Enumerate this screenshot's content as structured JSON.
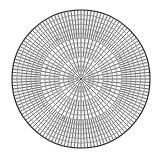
{
  "diagram": {
    "background_color": "#ffffff",
    "tick_color": "#111111",
    "ring_color": "#1c1c1c",
    "outer_border_color": "#141414",
    "speck_color": "#4a4a4a",
    "center": {
      "x": 81,
      "y": 79
    },
    "inner_radius": 3.5,
    "outer_radius": 69,
    "ring_count": 15,
    "base_spokes": 16,
    "target_arc_spacing": 2.8,
    "tick_stroke_width": 0.85,
    "ring_stroke_width": 0.55,
    "outer_border_width": 1.1,
    "center_dot_radius": 1.1,
    "inner_hub_spokes": 8,
    "tick_opacity": 0.78,
    "ring_opacity": 0.82,
    "specks": [
      {
        "x": 57,
        "y": 39,
        "r": 1.3
      },
      {
        "x": 97,
        "y": 33,
        "r": 1.1
      },
      {
        "x": 88,
        "y": 48,
        "r": 1.0
      },
      {
        "x": 47,
        "y": 68,
        "r": 1.2
      },
      {
        "x": 64,
        "y": 118,
        "r": 1.2
      },
      {
        "x": 99,
        "y": 128,
        "r": 1.0
      },
      {
        "x": 44,
        "y": 106,
        "r": 1.1
      },
      {
        "x": 110,
        "y": 90,
        "r": 1.0
      },
      {
        "x": 70,
        "y": 24,
        "r": 0.9
      },
      {
        "x": 120,
        "y": 58,
        "r": 0.9
      }
    ]
  }
}
